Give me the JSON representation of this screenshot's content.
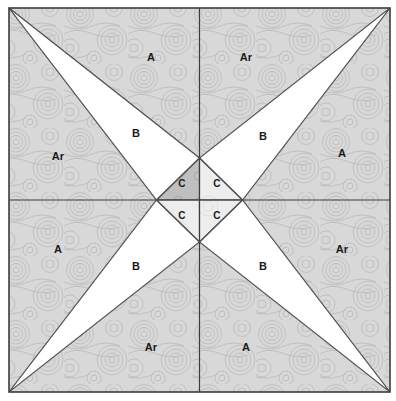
{
  "diagram": {
    "canvas": {
      "width": 396,
      "height": 401
    },
    "square": {
      "x": 9,
      "y": 8,
      "width": 381,
      "height": 384
    },
    "center_diamond": {
      "cx": 199.5,
      "cy": 200,
      "half_width": 43,
      "half_height": 42
    },
    "colors": {
      "background": "#ffffff",
      "textured_fill": "#d6d6d6",
      "textured_fill_dark": "#bdbdbd",
      "plain_fill": "#ffffff",
      "light_fill": "#ededed",
      "outline": "#4a4a4a",
      "label_text": "#1a1a1a",
      "swirl_stroke": "#c2c2c2"
    },
    "pieces": [
      {
        "id": "p-a-top-left",
        "label": "A",
        "x": 151,
        "y": 57,
        "fill": "textured",
        "quadrant": "top-left"
      },
      {
        "id": "p-ar-top-right",
        "label": "Ar",
        "x": 246,
        "y": 57,
        "fill": "textured",
        "quadrant": "top-right"
      },
      {
        "id": "p-ar-left-top",
        "label": "Ar",
        "x": 58,
        "y": 156,
        "fill": "textured",
        "quadrant": "top-left"
      },
      {
        "id": "p-b-top-left",
        "label": "B",
        "x": 136,
        "y": 133,
        "fill": "plain",
        "quadrant": "top-left"
      },
      {
        "id": "p-b-top-right",
        "label": "B",
        "x": 263,
        "y": 136,
        "fill": "plain",
        "quadrant": "top-right"
      },
      {
        "id": "p-a-right-top",
        "label": "A",
        "x": 342,
        "y": 153,
        "fill": "textured",
        "quadrant": "top-right"
      },
      {
        "id": "p-c-top-left",
        "label": "C",
        "x": 182,
        "y": 184,
        "fill": "textured-dark",
        "quadrant": "center"
      },
      {
        "id": "p-c-top-right",
        "label": "C",
        "x": 217,
        "y": 184,
        "fill": "light",
        "quadrant": "center"
      },
      {
        "id": "p-c-bottom-left",
        "label": "C",
        "x": 182,
        "y": 216,
        "fill": "light",
        "quadrant": "center"
      },
      {
        "id": "p-c-bottom-right",
        "label": "C",
        "x": 217,
        "y": 216,
        "fill": "light",
        "quadrant": "center"
      },
      {
        "id": "p-a-left-bottom",
        "label": "A",
        "x": 58,
        "y": 249,
        "fill": "textured",
        "quadrant": "bottom-left"
      },
      {
        "id": "p-ar-right-bottom",
        "label": "Ar",
        "x": 342,
        "y": 249,
        "fill": "textured",
        "quadrant": "bottom-right"
      },
      {
        "id": "p-b-bottom-left",
        "label": "B",
        "x": 136,
        "y": 266,
        "fill": "plain",
        "quadrant": "bottom-left"
      },
      {
        "id": "p-b-bottom-right",
        "label": "B",
        "x": 263,
        "y": 266,
        "fill": "plain",
        "quadrant": "bottom-right"
      },
      {
        "id": "p-ar-bottom-left",
        "label": "Ar",
        "x": 151,
        "y": 347,
        "fill": "textured",
        "quadrant": "bottom-left"
      },
      {
        "id": "p-a-bottom-right",
        "label": "A",
        "x": 246,
        "y": 347,
        "fill": "textured",
        "quadrant": "bottom-right"
      }
    ],
    "legend_keys": [
      "A",
      "Ar",
      "B",
      "C"
    ]
  }
}
